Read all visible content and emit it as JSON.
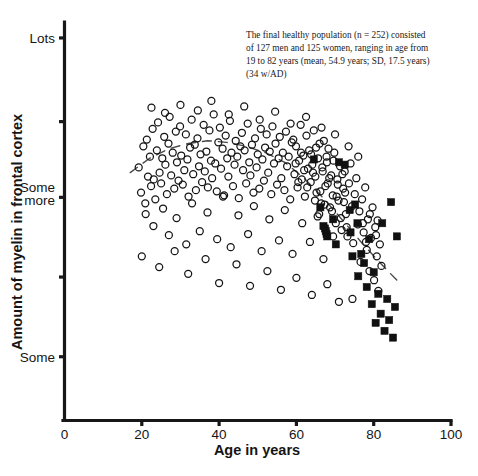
{
  "figure": {
    "annotation": {
      "line1": "The final healthy population (n = 252) consisted",
      "line2": "of 127 men and 125 women, ranging in age from",
      "line3": "19 to 82 years (mean, 54.9 years; SD, 17.5 years)",
      "line4": "(34 w/AD)"
    }
  },
  "chart_data": {
    "type": "scatter",
    "title": "",
    "xlabel": "Age in years",
    "ylabel": "Amount of myelin in frontal cortex",
    "xlim": [
      0,
      100
    ],
    "ylim": [
      0,
      10
    ],
    "grid": false,
    "legend_position": "none",
    "xticks": [
      0,
      20,
      40,
      60,
      80,
      100
    ],
    "xticklabels": [
      "0",
      "20",
      "40",
      "60",
      "80",
      "100"
    ],
    "yticks": [
      9.6,
      7.5,
      5.6,
      3.6,
      1.6
    ],
    "yticklabels": [
      "Lots",
      "",
      "Some more",
      "",
      "Some"
    ],
    "ytick_named": [
      {
        "value": 9.6,
        "label": "Lots"
      },
      {
        "value": 7.5,
        "label": ""
      },
      {
        "value": 5.6,
        "label": "Some more"
      },
      {
        "value": 3.6,
        "label": ""
      },
      {
        "value": 1.6,
        "label": "Some"
      }
    ],
    "series": [
      {
        "name": "Healthy subjects",
        "marker": "open-circle",
        "color": "#141414",
        "n": 252,
        "points": [
          [
            19.2,
            6.35
          ],
          [
            19.8,
            5.72
          ],
          [
            20.4,
            6.88
          ],
          [
            20.9,
            5.45
          ],
          [
            21.3,
            7.05
          ],
          [
            21.6,
            6.12
          ],
          [
            22.1,
            6.62
          ],
          [
            22.4,
            5.88
          ],
          [
            22.8,
            7.32
          ],
          [
            23.1,
            6.05
          ],
          [
            23.5,
            5.55
          ],
          [
            23.9,
            6.78
          ],
          [
            24.2,
            7.48
          ],
          [
            24.6,
            6.22
          ],
          [
            25.0,
            5.95
          ],
          [
            25.3,
            6.58
          ],
          [
            25.8,
            7.12
          ],
          [
            26.1,
            6.42
          ],
          [
            26.5,
            5.68
          ],
          [
            26.9,
            6.95
          ],
          [
            27.2,
            7.62
          ],
          [
            27.6,
            6.15
          ],
          [
            28.0,
            6.72
          ],
          [
            28.4,
            5.82
          ],
          [
            28.8,
            7.25
          ],
          [
            29.1,
            6.48
          ],
          [
            29.5,
            6.02
          ],
          [
            29.9,
            7.38
          ],
          [
            30.2,
            6.65
          ],
          [
            30.6,
            5.92
          ],
          [
            31.0,
            6.28
          ],
          [
            31.4,
            7.18
          ],
          [
            31.8,
            6.55
          ],
          [
            32.1,
            5.62
          ],
          [
            32.5,
            6.85
          ],
          [
            32.9,
            7.55
          ],
          [
            33.3,
            6.18
          ],
          [
            33.7,
            6.92
          ],
          [
            34.0,
            5.78
          ],
          [
            34.4,
            7.08
          ],
          [
            34.8,
            6.38
          ],
          [
            35.2,
            6.68
          ],
          [
            35.6,
            5.98
          ],
          [
            36.0,
            7.42
          ],
          [
            36.3,
            6.25
          ],
          [
            36.7,
            6.75
          ],
          [
            37.1,
            5.85
          ],
          [
            37.5,
            7.28
          ],
          [
            37.9,
            6.52
          ],
          [
            38.2,
            6.08
          ],
          [
            38.6,
            7.68
          ],
          [
            39.0,
            6.45
          ],
          [
            39.4,
            5.75
          ],
          [
            39.8,
            6.98
          ],
          [
            40.2,
            7.35
          ],
          [
            40.5,
            6.32
          ],
          [
            40.9,
            6.82
          ],
          [
            41.3,
            5.65
          ],
          [
            41.7,
            7.15
          ],
          [
            42.1,
            6.58
          ],
          [
            42.4,
            6.12
          ],
          [
            42.8,
            7.52
          ],
          [
            43.2,
            6.72
          ],
          [
            43.6,
            5.88
          ],
          [
            44.0,
            6.42
          ],
          [
            44.3,
            7.02
          ],
          [
            44.7,
            6.62
          ],
          [
            45.1,
            5.58
          ],
          [
            45.5,
            6.88
          ],
          [
            45.9,
            7.22
          ],
          [
            46.2,
            6.28
          ],
          [
            46.6,
            6.78
          ],
          [
            47.0,
            5.95
          ],
          [
            47.4,
            7.45
          ],
          [
            47.8,
            6.48
          ],
          [
            48.1,
            6.15
          ],
          [
            48.5,
            6.92
          ],
          [
            48.9,
            5.72
          ],
          [
            49.3,
            7.08
          ],
          [
            49.7,
            6.35
          ],
          [
            50.0,
            6.68
          ],
          [
            50.4,
            5.82
          ],
          [
            50.8,
            7.32
          ],
          [
            51.2,
            6.55
          ],
          [
            51.6,
            6.02
          ],
          [
            51.9,
            6.85
          ],
          [
            52.3,
            7.18
          ],
          [
            52.7,
            6.22
          ],
          [
            53.1,
            6.75
          ],
          [
            53.5,
            5.68
          ],
          [
            53.8,
            7.38
          ],
          [
            54.2,
            6.45
          ],
          [
            54.6,
            6.95
          ],
          [
            55.0,
            5.92
          ],
          [
            55.4,
            6.58
          ],
          [
            55.7,
            7.12
          ],
          [
            56.1,
            6.08
          ],
          [
            56.5,
            6.72
          ],
          [
            56.9,
            5.78
          ],
          [
            57.3,
            7.25
          ],
          [
            57.6,
            6.38
          ],
          [
            58.0,
            6.62
          ],
          [
            58.4,
            5.55
          ],
          [
            58.8,
            6.98
          ],
          [
            59.2,
            7.05
          ],
          [
            59.5,
            6.18
          ],
          [
            59.9,
            6.88
          ],
          [
            60.3,
            5.85
          ],
          [
            60.7,
            6.52
          ],
          [
            61.1,
            7.42
          ],
          [
            61.4,
            6.05
          ],
          [
            61.8,
            6.65
          ],
          [
            62.2,
            5.62
          ],
          [
            62.6,
            7.15
          ],
          [
            63.0,
            6.32
          ],
          [
            63.3,
            6.78
          ],
          [
            63.7,
            5.98
          ],
          [
            64.1,
            6.42
          ],
          [
            64.5,
            7.28
          ],
          [
            64.9,
            6.12
          ],
          [
            65.2,
            5.72
          ],
          [
            65.6,
            6.58
          ],
          [
            66.0,
            6.95
          ],
          [
            66.4,
            5.45
          ],
          [
            66.8,
            6.25
          ],
          [
            67.1,
            7.02
          ],
          [
            67.5,
            5.88
          ],
          [
            67.9,
            6.48
          ],
          [
            68.3,
            6.82
          ],
          [
            68.7,
            5.35
          ],
          [
            69.0,
            6.15
          ],
          [
            69.4,
            5.65
          ],
          [
            69.8,
            6.72
          ],
          [
            70.2,
            4.95
          ],
          [
            70.6,
            6.05
          ],
          [
            70.9,
            5.52
          ],
          [
            71.3,
            6.38
          ],
          [
            71.7,
            4.78
          ],
          [
            72.1,
            5.82
          ],
          [
            72.5,
            6.25
          ],
          [
            72.8,
            5.18
          ],
          [
            73.2,
            4.62
          ],
          [
            73.6,
            5.95
          ],
          [
            74.0,
            6.45
          ],
          [
            74.4,
            5.38
          ],
          [
            74.7,
            4.45
          ],
          [
            75.1,
            5.68
          ],
          [
            75.5,
            6.08
          ],
          [
            75.9,
            4.92
          ],
          [
            76.3,
            5.25
          ],
          [
            76.6,
            3.98
          ],
          [
            77.0,
            5.55
          ],
          [
            77.4,
            4.72
          ],
          [
            77.8,
            5.85
          ],
          [
            78.2,
            4.28
          ],
          [
            78.5,
            5.05
          ],
          [
            78.9,
            3.75
          ],
          [
            79.3,
            4.58
          ],
          [
            79.7,
            5.35
          ],
          [
            80.1,
            3.52
          ],
          [
            80.4,
            4.85
          ],
          [
            80.8,
            4.12
          ],
          [
            81.2,
            3.25
          ],
          [
            81.6,
            4.42
          ],
          [
            82.0,
            3.88
          ],
          [
            21.0,
            5.18
          ],
          [
            23.0,
            4.88
          ],
          [
            25.5,
            5.32
          ],
          [
            27.0,
            4.65
          ],
          [
            29.0,
            5.08
          ],
          [
            31.5,
            4.42
          ],
          [
            33.0,
            5.45
          ],
          [
            35.0,
            4.75
          ],
          [
            37.0,
            5.22
          ],
          [
            39.5,
            4.55
          ],
          [
            41.0,
            5.62
          ],
          [
            43.0,
            4.35
          ],
          [
            45.0,
            5.15
          ],
          [
            47.5,
            4.68
          ],
          [
            49.0,
            5.38
          ],
          [
            51.0,
            4.25
          ],
          [
            53.0,
            5.05
          ],
          [
            55.5,
            4.52
          ],
          [
            57.0,
            5.28
          ],
          [
            59.0,
            4.18
          ],
          [
            61.5,
            4.95
          ],
          [
            63.5,
            4.48
          ],
          [
            65.5,
            5.12
          ],
          [
            67.0,
            4.05
          ],
          [
            69.5,
            4.62
          ],
          [
            22.5,
            7.85
          ],
          [
            26.0,
            7.72
          ],
          [
            30.0,
            7.92
          ],
          [
            34.5,
            7.78
          ],
          [
            38.0,
            8.02
          ],
          [
            42.5,
            7.68
          ],
          [
            46.5,
            7.88
          ],
          [
            50.5,
            7.55
          ],
          [
            54.5,
            7.75
          ],
          [
            58.5,
            7.45
          ],
          [
            62.5,
            7.62
          ],
          [
            66.5,
            7.35
          ],
          [
            70.0,
            7.18
          ],
          [
            73.5,
            6.88
          ],
          [
            76.0,
            6.62
          ],
          [
            20.0,
            4.12
          ],
          [
            24.5,
            3.85
          ],
          [
            28.5,
            4.25
          ],
          [
            32.0,
            3.68
          ],
          [
            36.5,
            4.05
          ],
          [
            40.0,
            3.45
          ],
          [
            44.5,
            3.92
          ],
          [
            48.0,
            3.38
          ],
          [
            52.5,
            3.75
          ],
          [
            56.0,
            3.28
          ],
          [
            60.0,
            3.58
          ],
          [
            64.0,
            3.15
          ],
          [
            68.0,
            3.42
          ],
          [
            71.0,
            2.98
          ],
          [
            74.5,
            3.05
          ],
          [
            64.8,
            5.52
          ],
          [
            65.9,
            5.18
          ],
          [
            66.2,
            5.75
          ],
          [
            67.3,
            5.42
          ],
          [
            68.1,
            5.95
          ],
          [
            69.2,
            5.25
          ],
          [
            70.4,
            5.62
          ],
          [
            71.5,
            5.08
          ],
          [
            72.3,
            5.48
          ],
          [
            73.0,
            4.85
          ],
          [
            63.8,
            6.68
          ],
          [
            64.3,
            6.22
          ],
          [
            65.1,
            6.85
          ],
          [
            66.7,
            6.35
          ],
          [
            67.8,
            6.62
          ],
          [
            68.5,
            6.08
          ],
          [
            69.6,
            6.52
          ],
          [
            70.7,
            5.92
          ],
          [
            71.9,
            6.18
          ],
          [
            72.6,
            5.72
          ],
          [
            59.8,
            6.45
          ],
          [
            60.5,
            5.98
          ],
          [
            61.2,
            6.72
          ],
          [
            62.0,
            6.28
          ],
          [
            62.8,
            5.85
          ],
          [
            77.2,
            4.95
          ],
          [
            78.0,
            4.48
          ],
          [
            79.0,
            5.18
          ],
          [
            80.6,
            4.65
          ],
          [
            81.0,
            5.02
          ]
        ]
      },
      {
        "name": "Subjects with AD",
        "marker": "filled-square",
        "color": "#111111",
        "n": 34,
        "points": [
          [
            64.5,
            6.55
          ],
          [
            66.2,
            5.35
          ],
          [
            67.0,
            4.88
          ],
          [
            67.4,
            4.82
          ],
          [
            67.6,
            4.75
          ],
          [
            67.8,
            4.68
          ],
          [
            68.0,
            4.62
          ],
          [
            69.5,
            5.05
          ],
          [
            70.2,
            4.42
          ],
          [
            71.0,
            6.48
          ],
          [
            72.5,
            6.42
          ],
          [
            73.8,
            5.28
          ],
          [
            74.5,
            4.12
          ],
          [
            75.2,
            5.42
          ],
          [
            76.0,
            3.62
          ],
          [
            76.8,
            4.18
          ],
          [
            77.5,
            3.95
          ],
          [
            78.2,
            3.35
          ],
          [
            78.8,
            4.55
          ],
          [
            79.5,
            2.92
          ],
          [
            80.0,
            3.72
          ],
          [
            80.5,
            2.45
          ],
          [
            81.2,
            3.18
          ],
          [
            81.8,
            2.68
          ],
          [
            82.2,
            4.95
          ],
          [
            82.8,
            2.25
          ],
          [
            83.5,
            3.05
          ],
          [
            84.0,
            2.52
          ],
          [
            84.5,
            5.48
          ],
          [
            85.0,
            2.08
          ],
          [
            85.5,
            2.85
          ],
          [
            86.0,
            4.62
          ],
          [
            74.0,
            4.72
          ],
          [
            75.8,
            4.95
          ]
        ]
      }
    ],
    "trendline": {
      "style": "dashed",
      "color": "#4a4a4a",
      "points": [
        [
          17.0,
          6.22
        ],
        [
          22.0,
          6.58
        ],
        [
          27.0,
          6.82
        ],
        [
          32.0,
          6.95
        ],
        [
          37.0,
          7.02
        ],
        [
          42.0,
          6.98
        ],
        [
          47.0,
          6.88
        ],
        [
          52.0,
          6.72
        ],
        [
          57.0,
          6.48
        ],
        [
          62.0,
          6.08
        ],
        [
          67.0,
          5.58
        ],
        [
          72.0,
          5.02
        ],
        [
          77.0,
          4.45
        ],
        [
          82.0,
          3.92
        ],
        [
          86.0,
          3.52
        ]
      ]
    }
  }
}
